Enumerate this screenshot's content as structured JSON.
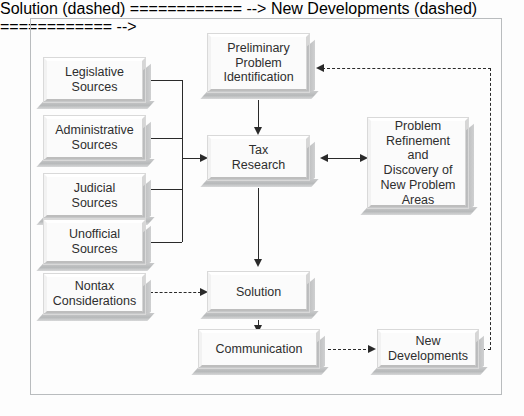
{
  "diagram": {
    "nodes": {
      "legislative_sources": "Legislative\nSources",
      "administrative_sources": "Administrative\nSources",
      "judicial_sources": "Judicial\nSources",
      "unofficial_sources": "Unofficial\nSources",
      "nontax_considerations": "Nontax\nConsiderations",
      "preliminary_problem_identification": "Preliminary\nProblem\nIdentification",
      "tax_research": "Tax\nResearch",
      "problem_refinement": "Problem\nRefinement and\nDiscovery of\nNew Problem\nAreas",
      "solution": "Solution",
      "communication": "Communication",
      "new_developments": "New\nDevelopments"
    },
    "colors": {
      "box_face": "#fbfbfb",
      "box_bevel_light": "#ffffff",
      "box_bevel_dark": "#bdbdbd",
      "box_shadow": "#c0c2c3",
      "line": "#2a2a2a",
      "frame": "#b9bcbe",
      "text": "#2e2e2e",
      "background": "#fdfdfd"
    }
  }
}
